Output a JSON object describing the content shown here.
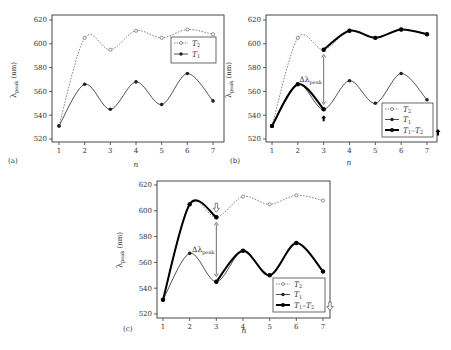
{
  "figure": {
    "colors": {
      "axis": "#333333",
      "t2": "#666666",
      "t1": "#222222",
      "bold": "#000000",
      "legend_border": "#444444"
    }
  },
  "chart_data": [
    {
      "id": "a",
      "panel_label": "(a)",
      "type": "line",
      "xlabel": "n",
      "ylabel": "λpeak (nm)",
      "ylabel_main": "λ",
      "ylabel_sub": "peak",
      "ylabel_unit": " (nm)",
      "x": [
        1,
        2,
        3,
        4,
        5,
        6,
        7
      ],
      "xticks": [
        "1",
        "2",
        "3",
        "4",
        "5",
        "6",
        "7"
      ],
      "yticks": [
        "520",
        "540",
        "560",
        "580",
        "600",
        "620"
      ],
      "ylim": [
        520,
        620
      ],
      "grid": false,
      "legend_position": "upper right",
      "series": [
        {
          "name": "T2",
          "legend_main": "T",
          "legend_sub": "2",
          "style": "dotted-open-circle",
          "values": [
            531,
            605,
            595,
            611,
            605,
            612,
            608
          ]
        },
        {
          "name": "T1",
          "legend_main": "T",
          "legend_sub": "1",
          "style": "solid-filled-circle",
          "values": [
            531,
            566,
            545,
            568,
            549,
            575,
            552
          ]
        }
      ]
    },
    {
      "id": "b",
      "panel_label": "(b)",
      "type": "line",
      "xlabel": "n",
      "ylabel": "λpeak (nm)",
      "ylabel_main": "λ",
      "ylabel_sub": "peak",
      "ylabel_unit": " (nm)",
      "x": [
        1,
        2,
        3,
        4,
        5,
        6,
        7
      ],
      "xticks": [
        "1",
        "2",
        "3",
        "4",
        "5",
        "6",
        "7"
      ],
      "yticks": [
        "520",
        "540",
        "560",
        "580",
        "600",
        "620"
      ],
      "ylim": [
        520,
        620
      ],
      "grid": false,
      "legend_position": "lower right",
      "annotation": {
        "text_main": "Δλ",
        "text_sub": "peak",
        "at_n": 3,
        "from": 549,
        "to": 591,
        "arrow": "up-filled",
        "arrow_at": "T1 n=3"
      },
      "series": [
        {
          "name": "T2",
          "legend_main": "T",
          "legend_sub": "2",
          "style": "dotted-open-circle",
          "values": [
            531,
            605,
            595,
            611,
            605,
            612,
            608
          ]
        },
        {
          "name": "T1",
          "legend_main": "T",
          "legend_sub": "1",
          "style": "solid-filled-circle",
          "values": [
            531,
            566,
            545,
            569,
            550,
            575,
            553
          ]
        },
        {
          "name": "T1-T2",
          "legend_main": "T",
          "legend_sub": "1",
          "legend_tail": "–T",
          "legend_sub2": "2",
          "style": "bold-path",
          "path": "T1 from n=1..3, jump to T2 at n=3, T2 n=3..7"
        }
      ]
    },
    {
      "id": "c",
      "panel_label": "(c)",
      "type": "line",
      "xlabel": "n",
      "ylabel": "λpeak (nm)",
      "ylabel_main": "λ",
      "ylabel_sub": "peak",
      "ylabel_unit": " (nm)",
      "x": [
        1,
        2,
        3,
        4,
        5,
        6,
        7
      ],
      "xticks": [
        "1",
        "2",
        "3",
        "4",
        "5",
        "6",
        "7"
      ],
      "yticks": [
        "520",
        "540",
        "560",
        "580",
        "600",
        "620"
      ],
      "ylim": [
        520,
        620
      ],
      "grid": false,
      "legend_position": "lower right",
      "annotation": {
        "text_main": "Δλ",
        "text_sub": "peak",
        "at_n": 3,
        "from": 549,
        "to": 591,
        "arrow": "down-open",
        "arrow_at": "T2 n=3"
      },
      "series": [
        {
          "name": "T2",
          "legend_main": "T",
          "legend_sub": "2",
          "style": "dotted-open-circle",
          "values": [
            531,
            605,
            595,
            611,
            605,
            612,
            608
          ]
        },
        {
          "name": "T1",
          "legend_main": "T",
          "legend_sub": "1",
          "style": "solid-filled-circle",
          "values": [
            531,
            567,
            545,
            569,
            550,
            575,
            553
          ]
        },
        {
          "name": "T1-T2",
          "legend_main": "T",
          "legend_sub": "1",
          "legend_tail": "–T",
          "legend_sub2": "2",
          "style": "bold-path",
          "path": "T2 from n=1..3, jump to T1 at n=3, T1 n=3..7"
        }
      ]
    }
  ]
}
